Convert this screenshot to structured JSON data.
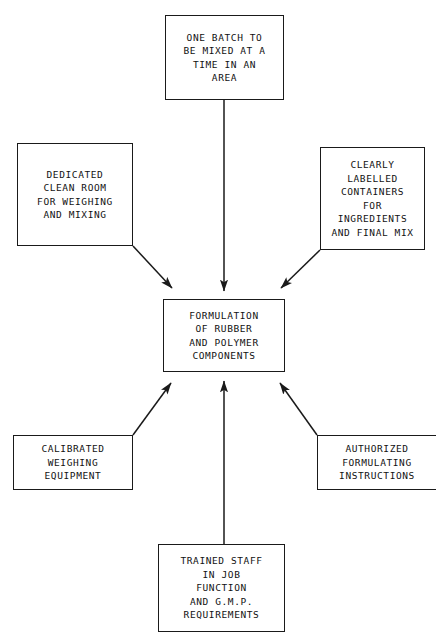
{
  "diagram": {
    "type": "flow-diagram",
    "title": "",
    "center_node": {
      "id": "formulation",
      "label": "FORMULATION\nOF RUBBER\nAND POLYMER\nCOMPONENTS"
    },
    "nodes": [
      {
        "id": "one-batch",
        "label": "ONE BATCH TO\nBE MIXED AT A\nTIME IN AN\nAREA",
        "position": "top"
      },
      {
        "id": "clean-room",
        "label": "DEDICATED\nCLEAN ROOM\nFOR WEIGHING\nAND MIXING",
        "position": "top-left"
      },
      {
        "id": "containers",
        "label": "CLEARLY\nLABELLED\nCONTAINERS\nFOR\nINGREDIENTS\nAND FINAL MIX",
        "position": "top-right"
      },
      {
        "id": "calibrated",
        "label": "CALIBRATED\nWEIGHING\nEQUIPMENT",
        "position": "bottom-left"
      },
      {
        "id": "authorized",
        "label": "AUTHORIZED\nFORMULATING\nINSTRUCTIONS",
        "position": "bottom-right"
      },
      {
        "id": "trained-staff",
        "label": "TRAINED STAFF\nIN JOB\nFUNCTION\nAND G.M.P.\nREQUIREMENTS",
        "position": "bottom"
      }
    ],
    "edges": [
      {
        "from": "one-batch",
        "to": "formulation",
        "arrow": "single"
      },
      {
        "from": "clean-room",
        "to": "formulation",
        "arrow": "single"
      },
      {
        "from": "containers",
        "to": "formulation",
        "arrow": "single"
      },
      {
        "from": "calibrated",
        "to": "formulation",
        "arrow": "single"
      },
      {
        "from": "authorized",
        "to": "formulation",
        "arrow": "single"
      },
      {
        "from": "trained-staff",
        "to": "formulation",
        "arrow": "single"
      }
    ],
    "colors": {
      "stroke": "#1a1a1a",
      "text": "#111111",
      "background": "#ffffff"
    }
  }
}
